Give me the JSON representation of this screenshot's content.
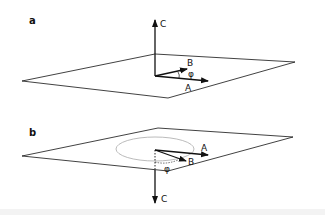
{
  "panels": [
    {
      "id": "a",
      "label": "a",
      "vectors": {
        "a": "A",
        "b": "B",
        "c": "C"
      },
      "angle_label": "φ",
      "c_direction": "up"
    },
    {
      "id": "b",
      "label": "b",
      "vectors": {
        "a": "A",
        "b": "B",
        "c": "C"
      },
      "angle_label": "φ",
      "c_direction": "down",
      "has_circle": true
    }
  ],
  "colors": {
    "stroke": "#111111",
    "circle": "#aaaaaa"
  }
}
